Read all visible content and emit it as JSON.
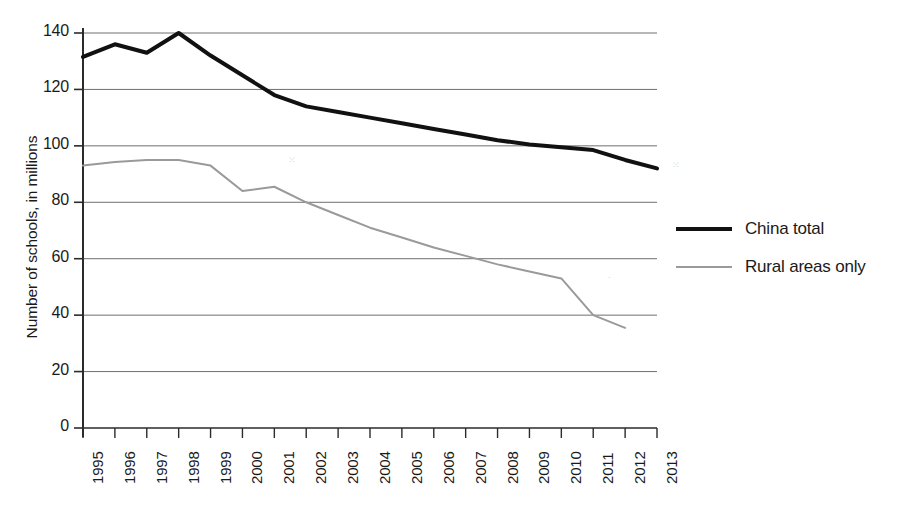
{
  "chart_data": {
    "type": "line",
    "title": "",
    "xlabel": "",
    "ylabel": "Number of schools, in millions",
    "ylim": [
      0,
      140
    ],
    "yticks": [
      0,
      20,
      40,
      60,
      80,
      100,
      120,
      140
    ],
    "ytick_labels": [
      "0",
      "20",
      "40",
      "60",
      "80",
      "100",
      "120",
      "140"
    ],
    "grid": true,
    "grid_axis": "y",
    "legend_position": "right",
    "categories": [
      "1995",
      "1996",
      "1997",
      "1998",
      "1999",
      "2000",
      "2001",
      "2002",
      "2003",
      "2004",
      "2005",
      "2006",
      "2007",
      "2008",
      "2009",
      "2010",
      "2011",
      "2012",
      "2013"
    ],
    "x": [
      1995,
      1996,
      1997,
      1998,
      1999,
      2000,
      2001,
      2002,
      2003,
      2004,
      2005,
      2006,
      2007,
      2008,
      2009,
      2010,
      2011,
      2012,
      2013
    ],
    "series": [
      {
        "name": "China total",
        "color": "#111111",
        "line_width": 4,
        "values": [
          131.5,
          136.0,
          133.0,
          140.0,
          132.0,
          125.0,
          118.0,
          114.0,
          112.0,
          110.0,
          108.0,
          106.0,
          104.0,
          102.0,
          100.5,
          99.5,
          98.5,
          95.0,
          92.0
        ]
      },
      {
        "name": "Rural areas only",
        "color": "#9a9a9a",
        "line_width": 2,
        "values": [
          93.0,
          94.3,
          95.0,
          95.0,
          93.0,
          84.0,
          85.5,
          80.0,
          75.5,
          71.0,
          67.5,
          64.0,
          61.0,
          58.0,
          55.5,
          53.0,
          40.0,
          35.5,
          null
        ]
      }
    ]
  },
  "axis": {
    "y_title": "Number of schools, in millions"
  },
  "legend": {
    "entries": [
      {
        "label": "China total",
        "style": "thick",
        "color": "#111111"
      },
      {
        "label": "Rural areas only",
        "style": "thin",
        "color": "#9a9a9a"
      }
    ]
  },
  "colors": {
    "total_line": "#111111",
    "rural_line": "#9a9a9a",
    "gridline": "#6f6f6f",
    "axis": "#2b2b2b",
    "background": "#ffffff"
  },
  "geometry": {
    "plot_left": 83,
    "plot_right": 657,
    "y_top_px": 33,
    "y_bottom_px": 428,
    "y_max": 140
  }
}
